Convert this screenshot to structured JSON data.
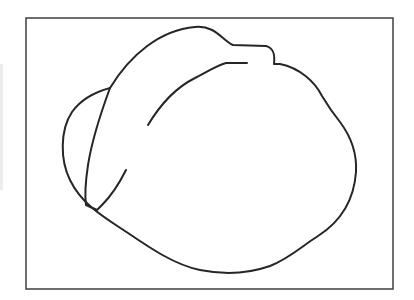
{
  "drawing": {
    "subject": "line-drawing-sketch",
    "frame": {
      "x": 26,
      "y": 18,
      "width": 367,
      "height": 271,
      "color": "#4a4a4a"
    },
    "stroke_color": "#262626",
    "background": "#ffffff",
    "strokes": [
      {
        "name": "outer-outline",
        "d": "M110,88 C130,55 160,30 195,27 C215,25 222,40 233,45 L266,46 C274,48 275,55 274,64 L280,64 C300,68 315,82 322,96 C328,106 332,112 340,122 C352,138 357,155 356,172 C354,200 340,222 318,236 C302,246 290,258 270,266 C250,273 225,275 200,270 C175,265 150,248 128,233 C105,218 82,205 70,180 C60,160 60,130 72,112 C82,98 95,92 110,88 Z"
      },
      {
        "name": "spine-stroke",
        "d": "M110,88 C100,115 92,140 88,165 C85,185 85,198 86,205 L97,210 L102,205 C112,195 120,182 126,170"
      },
      {
        "name": "inner-arc",
        "d": "M148,125 C160,105 175,88 195,78 C210,70 218,65 226,63 L247,63"
      }
    ]
  }
}
